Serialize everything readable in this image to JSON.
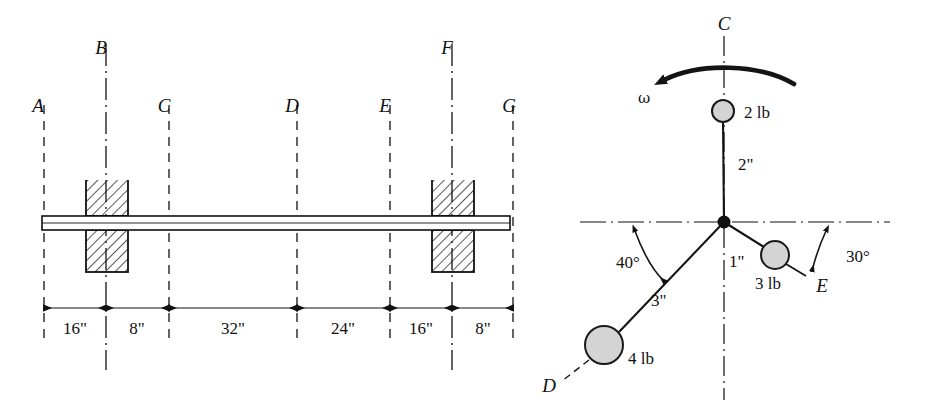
{
  "figure": {
    "colors": {
      "line": "#111111",
      "ball_fill": "#d4d4d4",
      "ball_stroke": "#1a1a1a",
      "background": "#ffffff"
    }
  },
  "left_diagram": {
    "name": "shaft-elevation-view",
    "station_labels": [
      {
        "id": "A",
        "text": "A",
        "x": 44,
        "line_style": "dashed"
      },
      {
        "id": "B",
        "text": "B",
        "x": 106,
        "line_style": "dashdot"
      },
      {
        "id": "C",
        "text": "C",
        "x": 169,
        "line_style": "dashed"
      },
      {
        "id": "D",
        "text": "D",
        "x": 297,
        "line_style": "dashed"
      },
      {
        "id": "E",
        "text": "E",
        "x": 390,
        "line_style": "dashed"
      },
      {
        "id": "F",
        "text": "F",
        "x": 452,
        "line_style": "dashdot"
      },
      {
        "id": "G",
        "text": "G",
        "x": 513,
        "line_style": "dashed"
      }
    ],
    "dimensions": [
      {
        "label": "16\"",
        "from": "A",
        "to": "B",
        "x1": 44,
        "x2": 106
      },
      {
        "label": "8\"",
        "from": "B",
        "to": "C",
        "x1": 106,
        "x2": 169
      },
      {
        "label": "32\"",
        "from": "C",
        "to": "D",
        "x1": 169,
        "x2": 297
      },
      {
        "label": "24\"",
        "from": "D",
        "to": "E",
        "x1": 297,
        "x2": 390
      },
      {
        "label": "16\"",
        "from": "E",
        "to": "F",
        "x1": 390,
        "x2": 452
      },
      {
        "label": "8\"",
        "from": "F",
        "to": "G",
        "x1": 452,
        "x2": 513
      }
    ],
    "bearings": [
      {
        "at": "B",
        "x": 106
      },
      {
        "at": "F",
        "x": 452
      }
    ]
  },
  "right_diagram": {
    "name": "rotor-end-view",
    "hub": {
      "cx": 724,
      "cy": 222
    },
    "axis_label_top": "C",
    "rotation": {
      "symbol": "ω",
      "direction": "counterclockwise"
    },
    "masses": [
      {
        "id": "2lb",
        "weight_label": "2 lb",
        "radius_label": "2\"",
        "angle_deg": 90,
        "direction_name": "up-along-C-axis",
        "cx": 723,
        "cy": 111,
        "r": 11
      },
      {
        "id": "3lb",
        "weight_label": "3 lb",
        "radius_label": "1\"",
        "angle_deg": -30,
        "direction_name": "toward-E",
        "cx": 775,
        "cy": 255,
        "r": 14
      },
      {
        "id": "4lb",
        "weight_label": "4 lb",
        "radius_label": "3\"",
        "angle_deg": -140,
        "direction_name": "toward-D",
        "cx": 604,
        "cy": 345,
        "r": 19
      }
    ],
    "angles": [
      {
        "label": "40°",
        "from_axis": "horizontal-left",
        "toward": "D",
        "x": 627,
        "y": 264
      },
      {
        "label": "30°",
        "from_axis": "horizontal-right",
        "toward": "E",
        "x": 850,
        "y": 257
      }
    ],
    "radial_labels": [
      {
        "label": "2\"",
        "x": 740,
        "y": 167
      },
      {
        "label": "1\"",
        "x": 733,
        "y": 263
      },
      {
        "label": "3\"",
        "x": 660,
        "y": 300
      }
    ],
    "point_labels": [
      {
        "text": "D",
        "x": 549,
        "y": 390
      },
      {
        "text": "E",
        "x": 830,
        "y": 285
      },
      {
        "text": "C",
        "x": 718,
        "y": 24
      }
    ]
  }
}
